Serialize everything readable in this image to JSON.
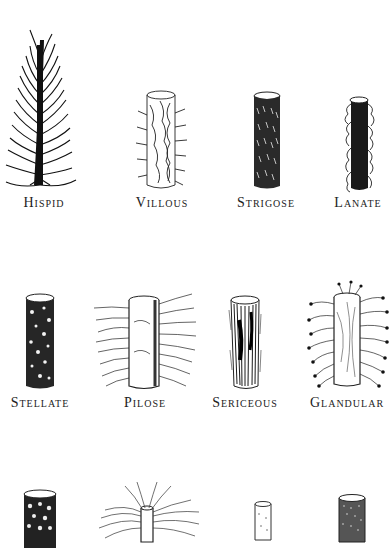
{
  "figure": {
    "rows": [
      {
        "items": [
          {
            "id": "hispid",
            "label": "Hispid",
            "cx": 44,
            "label_y": 195
          },
          {
            "id": "villous",
            "label": "Villous",
            "cx": 162,
            "label_y": 195
          },
          {
            "id": "strigose",
            "label": "Strigose",
            "cx": 266,
            "label_y": 195
          },
          {
            "id": "lanate",
            "label": "Lanate",
            "cx": 358,
            "label_y": 195
          }
        ]
      },
      {
        "items": [
          {
            "id": "stellate",
            "label": "Stellate",
            "cx": 40,
            "label_y": 395
          },
          {
            "id": "pilose",
            "label": "Pilose",
            "cx": 145,
            "label_y": 395
          },
          {
            "id": "sericeous",
            "label": "Sericeous",
            "cx": 245,
            "label_y": 395
          },
          {
            "id": "glandular",
            "label": "Glandular",
            "cx": 347,
            "label_y": 395
          }
        ]
      },
      {
        "items": [
          {
            "id": "scabrous",
            "label": "",
            "cx": 40
          },
          {
            "id": "tomentose",
            "label": "",
            "cx": 148
          },
          {
            "id": "puberulent",
            "label": "",
            "cx": 263
          },
          {
            "id": "scurfy",
            "label": "",
            "cx": 351
          }
        ]
      }
    ]
  }
}
